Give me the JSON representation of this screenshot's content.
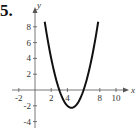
{
  "problem_label": "5.",
  "chart_data": {
    "type": "line",
    "title": "",
    "xlabel": "x",
    "ylabel": "y",
    "xlim": [
      -2,
      11
    ],
    "ylim": [
      -4.5,
      10
    ],
    "x_ticks": [
      -2,
      2,
      4,
      8,
      10
    ],
    "y_ticks": [
      -4,
      -2,
      2,
      4,
      6,
      8
    ],
    "x_tick_labels": [
      "-2",
      "2",
      "4",
      "8",
      "10"
    ],
    "y_tick_labels": [
      "-4",
      "-2",
      "2",
      "4",
      "6",
      "8"
    ],
    "grid": false,
    "legend": null,
    "series": [
      {
        "name": "parabola",
        "equation": "y = x^2 - 9x + 18",
        "x": [
          1.2,
          2,
          3,
          4,
          4.5,
          5,
          6,
          7,
          7.8
        ],
        "values": [
          8.64,
          4,
          0,
          -2,
          -2.25,
          -2,
          0,
          4,
          7.84
        ]
      }
    ],
    "annotations": {
      "vertex": [
        4.5,
        -2.25
      ],
      "x_intercepts": [
        3,
        6
      ]
    }
  }
}
